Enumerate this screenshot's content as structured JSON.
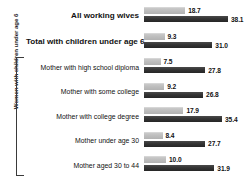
{
  "chart_data": {
    "type": "bar",
    "orientation": "horizontal",
    "title": "",
    "xlabel": "",
    "ylabel": "Women with children under age 6",
    "grid": false,
    "legend_position": "none",
    "xlim": [
      0,
      40
    ],
    "categories": [
      "All working wives",
      "Total with children under age 6",
      "Mother with high school diploma",
      "Mother with some college",
      "Mother with college degree",
      "Mother under age 30",
      "Mother aged 30 to 44"
    ],
    "series": [
      {
        "name": "light-series",
        "color": "#bdbdbd",
        "values": [
          18.7,
          9.3,
          7.5,
          9.2,
          17.9,
          8.4,
          10.0
        ]
      },
      {
        "name": "dark-series",
        "color": "#343434",
        "values": [
          38.1,
          31.0,
          27.8,
          26.8,
          35.4,
          27.7,
          31.9
        ]
      }
    ]
  },
  "axis": {
    "bracket_label": "Women with children under age 6"
  },
  "rows": [
    {
      "label": "All working wives",
      "emphasis": "top",
      "light_value": "18.7",
      "dark_value": "38.1"
    },
    {
      "label": "Total with children under age 6",
      "emphasis": "top",
      "light_value": "9.3",
      "dark_value": "31.0"
    },
    {
      "label": "Mother with high school diploma",
      "emphasis": "sub",
      "light_value": "7.5",
      "dark_value": "27.8"
    },
    {
      "label": "Mother with some college",
      "emphasis": "sub",
      "light_value": "9.2",
      "dark_value": "26.8"
    },
    {
      "label": "Mother with college degree",
      "emphasis": "sub",
      "light_value": "17.9",
      "dark_value": "35.4"
    },
    {
      "label": "Mother under age 30",
      "emphasis": "sub",
      "light_value": "8.4",
      "dark_value": "27.7"
    },
    {
      "label": "Mother aged 30 to 44",
      "emphasis": "sub",
      "light_value": "10.0",
      "dark_value": "31.9"
    }
  ]
}
